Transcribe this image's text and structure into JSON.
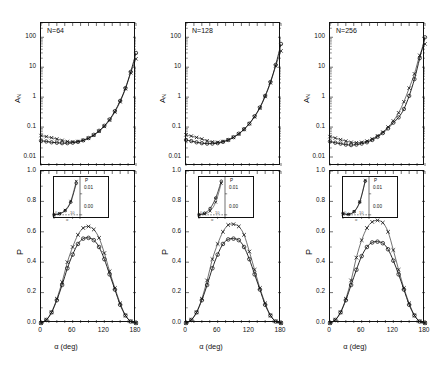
{
  "figure": {
    "kind": "multi-panel-scientific-figure",
    "columns": 3,
    "rows": 2,
    "series_legend": [
      {
        "marker": "circle",
        "symbol": "○"
      },
      {
        "marker": "cross",
        "symbol": "×"
      }
    ],
    "colors": {
      "ink": "#111111",
      "curve": "#222222",
      "grid": "#777777"
    }
  },
  "panels": {
    "top_y_title_main": "A",
    "top_y_title_sub": "N",
    "bottom_y_title": "P",
    "x_title": "α (deg)",
    "top_y_ticks": [
      "100",
      "10",
      "1",
      "0.1",
      "0.01"
    ],
    "bottom_y_ticks": [
      "1.0",
      "0.8",
      "0.6",
      "0.4",
      "0.2",
      "0.0"
    ],
    "x_ticks": [
      "0",
      "60",
      "120",
      "180"
    ],
    "inset_y_title": "P",
    "inset_y_ticks": [
      "0.01",
      "0.00"
    ],
    "inset_x_ticks": [
      "0",
      "10"
    ],
    "inset_x_title": "α",
    "labels": [
      "N=64",
      "N=128",
      "N=256"
    ]
  },
  "chart_data": [
    {
      "type": "line",
      "title": "N=64",
      "panel": "top-left",
      "xlabel": "α (deg)",
      "ylabel": "A_N",
      "yscale": "log",
      "xlim": [
        0,
        180
      ],
      "ylim": [
        0.005,
        300
      ],
      "ytick_values": [
        100,
        10,
        1,
        0.1,
        0.01
      ],
      "grid": false,
      "legend": "none",
      "x": [
        0,
        10,
        20,
        30,
        40,
        50,
        60,
        70,
        80,
        90,
        100,
        110,
        120,
        130,
        140,
        150,
        160,
        170,
        180
      ],
      "series": [
        {
          "name": "circle",
          "marker": "○",
          "values": [
            0.035,
            0.033,
            0.031,
            0.03,
            0.029,
            0.029,
            0.03,
            0.032,
            0.036,
            0.043,
            0.055,
            0.075,
            0.11,
            0.18,
            0.34,
            0.75,
            2.0,
            7.0,
            30.0
          ]
        },
        {
          "name": "cross",
          "marker": "×",
          "values": [
            0.052,
            0.048,
            0.044,
            0.04,
            0.036,
            0.033,
            0.032,
            0.033,
            0.036,
            0.042,
            0.053,
            0.072,
            0.105,
            0.17,
            0.32,
            0.7,
            1.9,
            6.5,
            19.0
          ]
        }
      ]
    },
    {
      "type": "line",
      "title": "N=128",
      "panel": "top-middle",
      "xlabel": "α (deg)",
      "ylabel": "A_N",
      "yscale": "log",
      "xlim": [
        0,
        180
      ],
      "ylim": [
        0.005,
        300
      ],
      "ytick_values": [
        100,
        10,
        1,
        0.1,
        0.01
      ],
      "grid": false,
      "legend": "none",
      "x": [
        0,
        10,
        20,
        30,
        40,
        50,
        60,
        70,
        80,
        90,
        100,
        110,
        120,
        130,
        140,
        150,
        160,
        170,
        180
      ],
      "series": [
        {
          "name": "circle",
          "marker": "○",
          "values": [
            0.037,
            0.034,
            0.031,
            0.029,
            0.028,
            0.028,
            0.029,
            0.032,
            0.037,
            0.046,
            0.06,
            0.085,
            0.13,
            0.23,
            0.45,
            1.1,
            3.2,
            12.0,
            60.0
          ]
        },
        {
          "name": "cross",
          "marker": "×",
          "values": [
            0.055,
            0.05,
            0.045,
            0.04,
            0.035,
            0.032,
            0.031,
            0.033,
            0.037,
            0.045,
            0.059,
            0.083,
            0.13,
            0.22,
            0.43,
            1.05,
            3.0,
            11.0,
            35.0
          ]
        }
      ]
    },
    {
      "type": "line",
      "title": "N=256",
      "panel": "top-right",
      "xlabel": "α (deg)",
      "ylabel": "A_N",
      "yscale": "log",
      "xlim": [
        0,
        180
      ],
      "ylim": [
        0.005,
        300
      ],
      "ytick_values": [
        100,
        10,
        1,
        0.1,
        0.01
      ],
      "grid": false,
      "legend": "none",
      "x": [
        0,
        10,
        20,
        30,
        40,
        50,
        60,
        70,
        80,
        90,
        100,
        110,
        120,
        130,
        140,
        150,
        160,
        170,
        180
      ],
      "series": [
        {
          "name": "circle",
          "marker": "○",
          "values": [
            0.033,
            0.03,
            0.028,
            0.026,
            0.025,
            0.026,
            0.028,
            0.031,
            0.037,
            0.047,
            0.063,
            0.09,
            0.14,
            0.21,
            0.4,
            1.1,
            4.0,
            20.0,
            100.0
          ]
        },
        {
          "name": "cross",
          "marker": "×",
          "values": [
            0.048,
            0.043,
            0.038,
            0.034,
            0.031,
            0.03,
            0.031,
            0.034,
            0.04,
            0.051,
            0.068,
            0.1,
            0.16,
            0.3,
            0.7,
            2.0,
            6.0,
            25.0,
            60.0
          ]
        }
      ]
    },
    {
      "type": "line",
      "panel": "bottom-left",
      "title": "",
      "xlabel": "α (deg)",
      "ylabel": "P",
      "yscale": "linear",
      "xlim": [
        0,
        180
      ],
      "ylim": [
        0.0,
        1.0
      ],
      "ytick_values": [
        1.0,
        0.8,
        0.6,
        0.4,
        0.2,
        0.0
      ],
      "xtick_values": [
        0,
        60,
        120,
        180
      ],
      "grid": false,
      "legend": "none",
      "x": [
        0,
        10,
        20,
        30,
        40,
        50,
        60,
        70,
        80,
        90,
        100,
        110,
        120,
        130,
        140,
        150,
        160,
        170,
        180
      ],
      "series": [
        {
          "name": "circle",
          "marker": "○",
          "values": [
            0.0,
            0.02,
            0.07,
            0.15,
            0.25,
            0.36,
            0.45,
            0.52,
            0.555,
            0.56,
            0.545,
            0.5,
            0.42,
            0.32,
            0.22,
            0.12,
            0.05,
            0.01,
            0.0
          ]
        },
        {
          "name": "cross",
          "marker": "×",
          "values": [
            0.0,
            0.02,
            0.07,
            0.16,
            0.27,
            0.4,
            0.5,
            0.58,
            0.625,
            0.635,
            0.615,
            0.56,
            0.46,
            0.34,
            0.23,
            0.13,
            0.05,
            0.01,
            0.0
          ]
        }
      ],
      "inset": {
        "ylabel": "P",
        "xlabel": "α",
        "ytick_values": [
          0.01,
          0.0
        ],
        "xtick_values": [
          0,
          10
        ],
        "xlim": [
          0,
          14
        ],
        "ylim": [
          -0.002,
          0.018
        ],
        "series": [
          {
            "name": "circle",
            "marker": "○",
            "x": [
              0,
              3,
              6,
              9,
              12
            ],
            "values": [
              0.0,
              0.0005,
              0.002,
              0.006,
              0.015
            ]
          },
          {
            "name": "cross",
            "marker": "×",
            "x": [
              0,
              3,
              6,
              9,
              12
            ],
            "values": [
              0.0,
              0.0006,
              0.0022,
              0.0065,
              0.016
            ]
          }
        ]
      }
    },
    {
      "type": "line",
      "panel": "bottom-middle",
      "title": "",
      "xlabel": "α (deg)",
      "ylabel": "P",
      "yscale": "linear",
      "xlim": [
        0,
        180
      ],
      "ylim": [
        0.0,
        1.0
      ],
      "ytick_values": [
        1.0,
        0.8,
        0.6,
        0.4,
        0.2,
        0.0
      ],
      "xtick_values": [
        0,
        60,
        120,
        180
      ],
      "grid": false,
      "legend": "none",
      "x": [
        0,
        10,
        20,
        30,
        40,
        50,
        60,
        70,
        80,
        90,
        100,
        110,
        120,
        130,
        140,
        150,
        160,
        170,
        180
      ],
      "series": [
        {
          "name": "circle",
          "marker": "○",
          "values": [
            0.0,
            0.02,
            0.07,
            0.15,
            0.25,
            0.36,
            0.45,
            0.52,
            0.55,
            0.555,
            0.545,
            0.5,
            0.42,
            0.32,
            0.22,
            0.12,
            0.05,
            0.01,
            0.0
          ]
        },
        {
          "name": "cross",
          "marker": "×",
          "values": [
            0.0,
            0.02,
            0.07,
            0.16,
            0.28,
            0.42,
            0.52,
            0.6,
            0.645,
            0.65,
            0.635,
            0.58,
            0.47,
            0.35,
            0.23,
            0.13,
            0.05,
            0.01,
            0.0
          ]
        }
      ],
      "inset": {
        "ylabel": "P",
        "xlabel": "α",
        "ytick_values": [
          0.01,
          0.0
        ],
        "xtick_values": [
          0,
          10
        ],
        "xlim": [
          0,
          14
        ],
        "ylim": [
          -0.002,
          0.018
        ],
        "series": [
          {
            "name": "circle",
            "marker": "○",
            "x": [
              0,
              3,
              6,
              9,
              12
            ],
            "values": [
              0.0,
              0.0008,
              0.003,
              0.008,
              0.016
            ]
          },
          {
            "name": "cross",
            "marker": "×",
            "x": [
              0,
              3,
              6,
              9,
              12
            ],
            "values": [
              0.0,
              0.0004,
              0.0018,
              0.006,
              0.015
            ]
          }
        ]
      }
    },
    {
      "type": "line",
      "panel": "bottom-right",
      "title": "",
      "xlabel": "α (deg)",
      "ylabel": "P",
      "yscale": "linear",
      "xlim": [
        0,
        180
      ],
      "ylim": [
        0.0,
        1.0
      ],
      "ytick_values": [
        1.0,
        0.8,
        0.6,
        0.4,
        0.2,
        0.0
      ],
      "xtick_values": [
        0,
        60,
        120,
        180
      ],
      "grid": false,
      "legend": "none",
      "x": [
        0,
        10,
        20,
        30,
        40,
        50,
        60,
        70,
        80,
        90,
        100,
        110,
        120,
        130,
        140,
        150,
        160,
        170,
        180
      ],
      "series": [
        {
          "name": "circle",
          "marker": "○",
          "values": [
            0.0,
            0.02,
            0.07,
            0.15,
            0.25,
            0.35,
            0.44,
            0.5,
            0.53,
            0.535,
            0.525,
            0.485,
            0.41,
            0.32,
            0.22,
            0.12,
            0.05,
            0.01,
            0.0
          ]
        },
        {
          "name": "cross",
          "marker": "×",
          "values": [
            0.0,
            0.02,
            0.07,
            0.16,
            0.28,
            0.43,
            0.545,
            0.625,
            0.665,
            0.675,
            0.66,
            0.6,
            0.48,
            0.35,
            0.23,
            0.13,
            0.05,
            0.01,
            0.0
          ]
        }
      ],
      "inset": {
        "ylabel": "P",
        "xlabel": "α",
        "ytick_values": [
          0.01,
          0.0
        ],
        "xtick_values": [
          0,
          10
        ],
        "xlim": [
          0,
          14
        ],
        "ylim": [
          -0.002,
          0.018
        ],
        "series": [
          {
            "name": "circle",
            "marker": "○",
            "x": [
              0,
              3,
              6,
              9,
              12
            ],
            "values": [
              0.0006,
              0.0002,
              0.0015,
              0.006,
              0.016
            ]
          },
          {
            "name": "cross",
            "marker": "×",
            "x": [
              0,
              3,
              6,
              9,
              12
            ],
            "values": [
              0.0004,
              0.0003,
              0.0016,
              0.0062,
              0.0165
            ]
          }
        ]
      }
    }
  ]
}
